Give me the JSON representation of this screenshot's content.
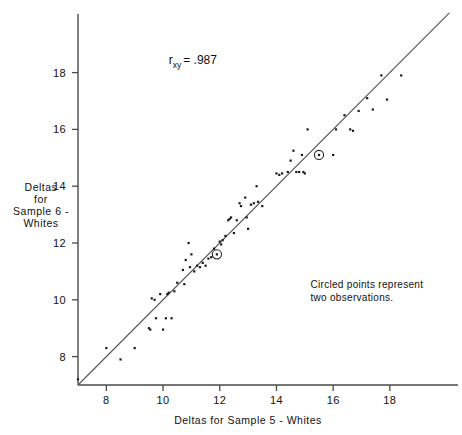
{
  "chart_data": {
    "type": "scatter",
    "title": "",
    "xlabel": "Deltas  for  Sample 5 - Whites",
    "ylabel_lines": [
      "Deltas",
      "for",
      "Sample 6 -",
      "Whites"
    ],
    "xlim": [
      7.0,
      20.4
    ],
    "ylim": [
      7.0,
      20.2
    ],
    "xticks": [
      8,
      10,
      12,
      14,
      16,
      18
    ],
    "yticks": [
      8,
      10,
      12,
      14,
      16,
      18
    ],
    "xticklabels": [
      "8",
      "10",
      "12",
      "14",
      "16",
      "18"
    ],
    "yticklabels": [
      "8",
      "10",
      "12",
      "14",
      "16",
      "18"
    ],
    "grid": false,
    "legend": "none",
    "annotations": [
      {
        "name": "correlation",
        "text_main": "r",
        "text_sub": "xy",
        "text_tail": "= .987",
        "x": 10.2,
        "y": 18.3
      },
      {
        "name": "circled-note",
        "line1": "Circled points represent",
        "line2": "two observations.",
        "x": 15.2,
        "y": 10.4
      }
    ],
    "reference_line": {
      "name": "identity-line",
      "type": "line",
      "x": [
        7.0,
        20.1
      ],
      "y": [
        7.0,
        20.1
      ],
      "label": "y = x"
    },
    "points": [
      [
        7.0,
        7.2
      ],
      [
        8.0,
        8.3
      ],
      [
        8.5,
        7.9
      ],
      [
        9.0,
        8.3
      ],
      [
        9.5,
        9.0
      ],
      [
        9.55,
        8.95
      ],
      [
        9.6,
        10.05
      ],
      [
        9.7,
        10.0
      ],
      [
        9.75,
        9.35
      ],
      [
        9.9,
        10.2
      ],
      [
        10.0,
        8.95
      ],
      [
        10.1,
        9.35
      ],
      [
        10.15,
        10.2
      ],
      [
        10.2,
        10.25
      ],
      [
        10.3,
        9.35
      ],
      [
        10.4,
        10.3
      ],
      [
        10.5,
        10.6
      ],
      [
        10.7,
        11.05
      ],
      [
        10.75,
        10.55
      ],
      [
        10.8,
        11.4
      ],
      [
        10.9,
        12.0
      ],
      [
        10.95,
        11.15
      ],
      [
        11.0,
        11.6
      ],
      [
        11.1,
        11.0
      ],
      [
        11.2,
        11.2
      ],
      [
        11.3,
        11.15
      ],
      [
        11.4,
        11.3
      ],
      [
        11.5,
        11.2
      ],
      [
        11.6,
        11.45
      ],
      [
        11.7,
        11.5
      ],
      [
        11.8,
        11.8
      ],
      [
        11.9,
        11.6
      ],
      [
        12.0,
        12.05
      ],
      [
        12.05,
        11.95
      ],
      [
        12.1,
        12.1
      ],
      [
        12.2,
        12.25
      ],
      [
        12.3,
        12.8
      ],
      [
        12.35,
        12.85
      ],
      [
        12.4,
        12.9
      ],
      [
        12.5,
        12.35
      ],
      [
        12.6,
        12.8
      ],
      [
        12.7,
        13.4
      ],
      [
        12.75,
        13.3
      ],
      [
        12.9,
        13.6
      ],
      [
        12.95,
        12.9
      ],
      [
        13.0,
        12.5
      ],
      [
        13.1,
        13.35
      ],
      [
        13.2,
        13.4
      ],
      [
        13.3,
        14.0
      ],
      [
        13.35,
        13.45
      ],
      [
        13.5,
        13.3
      ],
      [
        14.0,
        14.45
      ],
      [
        14.1,
        14.4
      ],
      [
        14.2,
        14.45
      ],
      [
        14.4,
        14.5
      ],
      [
        14.5,
        14.9
      ],
      [
        14.6,
        15.25
      ],
      [
        14.7,
        14.5
      ],
      [
        14.8,
        14.5
      ],
      [
        14.9,
        15.1
      ],
      [
        14.95,
        14.5
      ],
      [
        15.0,
        14.45
      ],
      [
        15.1,
        16.0
      ],
      [
        15.5,
        15.1
      ],
      [
        16.0,
        15.1
      ],
      [
        16.1,
        16.0
      ],
      [
        16.4,
        16.5
      ],
      [
        16.6,
        16.0
      ],
      [
        16.7,
        15.95
      ],
      [
        16.9,
        16.65
      ],
      [
        17.2,
        17.1
      ],
      [
        17.4,
        16.7
      ],
      [
        17.7,
        17.9
      ],
      [
        17.9,
        17.05
      ],
      [
        18.4,
        17.9
      ]
    ],
    "circled_points": [
      [
        11.9,
        11.6
      ],
      [
        15.5,
        15.1
      ]
    ]
  }
}
